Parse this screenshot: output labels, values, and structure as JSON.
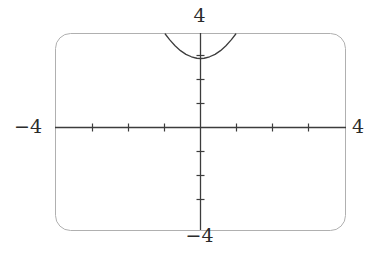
{
  "figure": {
    "kind": "graphing-calculator-screen",
    "background_color": "#ffffff",
    "frame_color": "#b3b3b3",
    "axis_color": "#3c3c3c",
    "curve_color": "#3c3c3c",
    "label_color": "#2b2b2b"
  },
  "labels": {
    "y_max": "4",
    "y_min": "−4",
    "x_min": "−4",
    "x_max": "4"
  },
  "chart_data": {
    "type": "line",
    "title": "",
    "xlabel": "",
    "ylabel": "",
    "xlim": [
      -4,
      4
    ],
    "ylim": [
      -4,
      4
    ],
    "grid": false,
    "legend": "none",
    "x_tick_labels": [
      "−4",
      "4"
    ],
    "y_tick_labels": [
      "4",
      "−4"
    ],
    "x_ticks": [
      -3,
      -2,
      -1,
      1,
      2,
      3
    ],
    "y_ticks": [
      -3,
      -2,
      -1,
      1,
      2,
      3
    ],
    "axes_drawn": [
      "x-axis",
      "y-axis"
    ],
    "series": [
      {
        "name": "curve",
        "shape": "upward-parabola",
        "vertex": [
          0,
          3
        ],
        "x": [
          -0.97,
          -0.85,
          -0.7,
          -0.55,
          -0.4,
          -0.25,
          -0.1,
          0.0,
          0.1,
          0.25,
          0.4,
          0.55,
          0.7,
          0.85,
          0.97
        ],
        "y": [
          4.0,
          3.77,
          3.52,
          3.32,
          3.17,
          3.07,
          3.01,
          3.0,
          3.01,
          3.07,
          3.17,
          3.32,
          3.52,
          3.77,
          4.0
        ]
      }
    ]
  }
}
